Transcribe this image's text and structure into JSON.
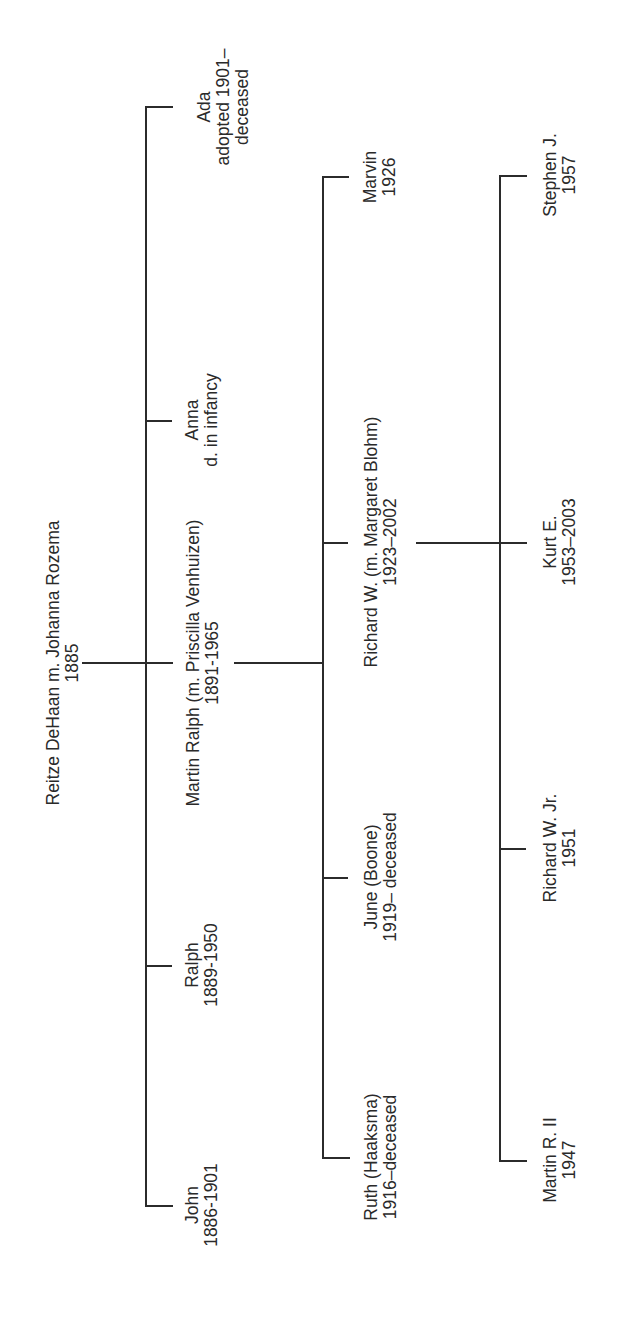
{
  "generation_0": {
    "name": "Reitze DeHaan m. Johanna Rozema",
    "dates": "1885"
  },
  "generation_1": [
    {
      "name": "Ada",
      "line2": "adopted 1901–",
      "line3": "deceased"
    },
    {
      "name": "Anna",
      "line2": "d. in infancy"
    },
    {
      "name": "Martin Ralph (m. Priscilla Venhuizen)",
      "line2": "1891-1965"
    },
    {
      "name": "Ralph",
      "line2": "1889-1950"
    },
    {
      "name": "John",
      "line2": "1886-1901"
    }
  ],
  "generation_2": [
    {
      "name": "Marvin",
      "line2": "1926"
    },
    {
      "name": "Richard W. (m. Margaret Blohm)",
      "line2": "1923–2002"
    },
    {
      "name": "June (Boone)",
      "line2": "1919– deceased"
    },
    {
      "name": "Ruth (Haaksma)",
      "line2": "1916–deceased"
    }
  ],
  "generation_3": [
    {
      "name": "Stephen J.",
      "line2": "1957"
    },
    {
      "name": "Kurt E.",
      "line2": "1953–2003"
    },
    {
      "name": "Richard W. Jr.",
      "line2": "1951"
    },
    {
      "name": "Martin R. II",
      "line2": "1947"
    }
  ],
  "colors": {
    "line": "#2b2b2b",
    "text": "#2a2a2a",
    "background": "#ffffff"
  }
}
